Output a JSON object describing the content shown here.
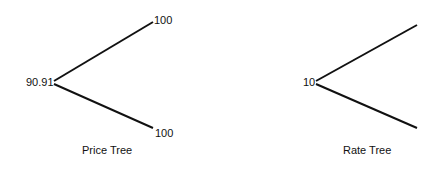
{
  "price_tree": {
    "title": "Price Tree",
    "root_value": "90.91",
    "up_value": "100",
    "down_value": "100"
  },
  "rate_tree": {
    "title": "Rate Tree",
    "root_value": "10"
  },
  "colors": {
    "line": "#111111",
    "background": "#ffffff"
  }
}
